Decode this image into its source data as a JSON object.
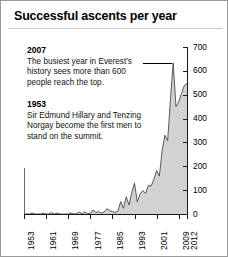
{
  "figure": {
    "title": "Successful ascents per year",
    "border_color": "#9a9a9a",
    "background": "#ffffff"
  },
  "annotations": [
    {
      "id": "anno-2007",
      "year": "2007",
      "text": "The busiest year in Everest's history sees more than 600 people reach the top.",
      "leader_line": true
    },
    {
      "id": "anno-1953",
      "year": "1953",
      "text": "Sir Edmund Hillary and Tenzing Norgay become the first men to stand on the summit.",
      "leader_line": false
    }
  ],
  "axes": {
    "y_ticks": [
      "0",
      "100",
      "200",
      "300",
      "400",
      "500",
      "600",
      "700"
    ],
    "x_ticks": [
      "1953",
      "1961",
      "1969",
      "1977",
      "1985",
      "1993",
      "2001",
      "2009",
      "2012"
    ]
  },
  "chart_data": {
    "type": "area",
    "title": "Successful ascents per year",
    "xlabel": "",
    "ylabel": "",
    "ylim": [
      0,
      700
    ],
    "xlim": [
      1953,
      2012
    ],
    "grid": false,
    "legend": null,
    "fill_color": "#d2d2d2",
    "line_color": "#4a4a4a",
    "categories": [
      1953,
      1954,
      1955,
      1956,
      1957,
      1958,
      1959,
      1960,
      1961,
      1962,
      1963,
      1964,
      1965,
      1966,
      1967,
      1968,
      1969,
      1970,
      1971,
      1972,
      1973,
      1974,
      1975,
      1976,
      1977,
      1978,
      1979,
      1980,
      1981,
      1982,
      1983,
      1984,
      1985,
      1986,
      1987,
      1988,
      1989,
      1990,
      1991,
      1992,
      1993,
      1994,
      1995,
      1996,
      1997,
      1998,
      1999,
      2000,
      2001,
      2002,
      2003,
      2004,
      2005,
      2006,
      2007,
      2008,
      2009,
      2010,
      2011,
      2012
    ],
    "values": [
      2,
      0,
      0,
      4,
      0,
      0,
      0,
      3,
      0,
      0,
      6,
      0,
      4,
      0,
      0,
      0,
      0,
      4,
      0,
      2,
      8,
      1,
      9,
      2,
      2,
      17,
      6,
      10,
      4,
      8,
      22,
      14,
      10,
      7,
      12,
      52,
      24,
      72,
      38,
      90,
      129,
      51,
      83,
      98,
      86,
      120,
      117,
      145,
      182,
      159,
      266,
      330,
      307,
      480,
      633,
      450,
      470,
      505,
      538,
      547
    ],
    "annotations": [
      {
        "x": 1953,
        "label": "1953",
        "note": "Sir Edmund Hillary and Tenzing Norgay become the first men to stand on the summit."
      },
      {
        "x": 2007,
        "label": "2007",
        "note": "The busiest year in Everest's history sees more than 600 people reach the top."
      }
    ]
  }
}
